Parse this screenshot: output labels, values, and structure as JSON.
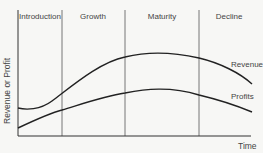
{
  "chart_data": {
    "type": "line",
    "title": "",
    "xlabel": "Time",
    "ylabel": "Revenue or Profit",
    "grid": false,
    "stages": [
      "Introduction",
      "Growth",
      "Maturity",
      "Decline"
    ],
    "stage_boundaries_x": [
      62,
      125,
      199
    ],
    "series": [
      {
        "name": "Revenue",
        "label": "Revenue",
        "color": "#222222",
        "description": "Flat/slight dip in Introduction, rises steeply through Growth, peaks mid-Maturity, falls in Decline",
        "path": "M18,108 C26,110 40,110 52,101 C72,86 100,62 125,57 C145,52 168,51 199,58 C220,63 240,73 252,84"
      },
      {
        "name": "Profits",
        "label": "Profits",
        "color": "#222222",
        "description": "Starts low, rises gradually, peaks in Maturity, declines in Decline",
        "path": "M18,128 C35,120 50,113 62,110 C85,103 105,96 125,93 C145,89 170,86 199,95 C220,100 240,107 252,112"
      }
    ],
    "legend": "inline labels at right end of curves"
  },
  "labels": {
    "stages": [
      "Introduction",
      "Growth",
      "Maturity",
      "Decline"
    ],
    "revenue": "Revenue",
    "profits": "Profits",
    "x_axis": "Time",
    "y_axis": "Revenue or Profit"
  },
  "colors": {
    "background": "#f7f7f5",
    "line": "#222222",
    "axis": "#333333",
    "divider": "#555555",
    "text": "#444444"
  }
}
